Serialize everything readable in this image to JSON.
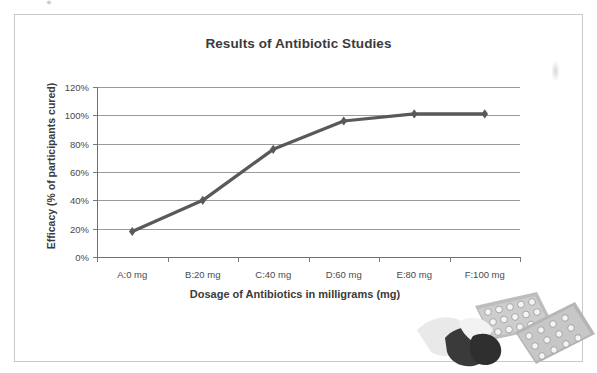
{
  "chart_data": {
    "type": "line",
    "title": "Results of Antibiotic Studies",
    "xlabel": "Dosage of Antibiotics in milligrams (mg)",
    "ylabel": "Efficacy (% of participants cured)",
    "categories": [
      "A:0 mg",
      "B:20 mg",
      "C:40 mg",
      "D:60 mg",
      "E:80 mg",
      "F:100 mg"
    ],
    "values": [
      18,
      40,
      76,
      96,
      101,
      101
    ],
    "value_labels": [
      "18%",
      "40%",
      "76%",
      "96%",
      "101%",
      "101%"
    ],
    "ytick_labels": [
      "0%",
      "20%",
      "40%",
      "60%",
      "80%",
      "100%",
      "120%"
    ],
    "ytick_values": [
      0,
      20,
      40,
      60,
      80,
      100,
      120
    ],
    "ylim": [
      0,
      120
    ],
    "grid": "horizontal",
    "legend": "none",
    "series_color": "#595959",
    "marker": "diamond",
    "gridline_color": "#9a9a9a",
    "axis_color": "#6f6f6f"
  },
  "decoration": {
    "clipart_name": "pills-and-blister-packs",
    "capsule_body_color": "#3a3a3a",
    "capsule_cap_color": "#e8e8e8",
    "blister_color": "#b5b5b5",
    "pill_color": "#f2f2f2"
  },
  "page": {
    "border_color": "#c8c8c8",
    "background": "#ffffff"
  }
}
